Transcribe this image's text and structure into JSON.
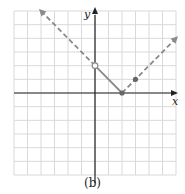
{
  "chart_data": {
    "type": "line",
    "title": "",
    "caption": "(b)",
    "xlabel": "x",
    "ylabel": "y",
    "xlim": [
      -6,
      6
    ],
    "ylim": [
      -6,
      6
    ],
    "grid": true,
    "grid_step": 1,
    "tick_labels": false,
    "series": [
      {
        "name": "left ray (dashed)",
        "style": "dashed",
        "points": [
          [
            -4,
            6
          ],
          [
            0,
            2
          ]
        ],
        "arrow_end": "start"
      },
      {
        "name": "middle segment (solid)",
        "style": "solid",
        "points": [
          [
            0,
            2
          ],
          [
            2,
            0
          ]
        ]
      },
      {
        "name": "right ray (dashed)",
        "style": "dashed",
        "points": [
          [
            2,
            0
          ],
          [
            6,
            4
          ]
        ],
        "arrow_end": "end"
      }
    ],
    "markers": [
      {
        "x": 0,
        "y": 2,
        "type": "open-circle"
      },
      {
        "x": 2,
        "y": 0,
        "type": "filled-circle"
      },
      {
        "x": 3,
        "y": 1,
        "type": "filled-circle"
      }
    ],
    "colors": {
      "curve": "#8a8a8a",
      "grid": "#d9d9d9",
      "axes": "#222222"
    }
  }
}
